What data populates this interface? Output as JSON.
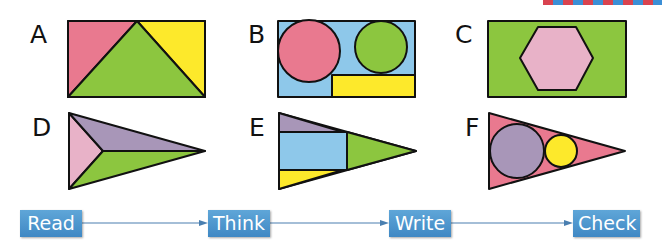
{
  "decoration": {
    "stripe_colors": [
      "#d9434f",
      "#3b8fd6"
    ]
  },
  "shapes": [
    {
      "letter": "A",
      "description": "rectangle split into pink and yellow corner triangles and a green central triangle"
    },
    {
      "letter": "B",
      "description": "blue rectangle with pink circle, green circle and yellow rectangle"
    },
    {
      "letter": "C",
      "description": "green rectangle containing a pink hexagon"
    },
    {
      "letter": "D",
      "description": "triangle split into pink, purple and green triangles"
    },
    {
      "letter": "E",
      "description": "triangle with purple triangle, blue rectangle, green triangle and yellow triangle"
    },
    {
      "letter": "F",
      "description": "pink triangle containing a purple circle and a yellow circle"
    }
  ],
  "colors": {
    "pink": "#e9798f",
    "yellow": "#fde92b",
    "green": "#8cc63f",
    "blue": "#8ec8ea",
    "light_pink": "#e8b2c8",
    "purple": "#a896b8",
    "stroke": "#111111",
    "button": "#4a93cd",
    "arrow": "#4a7fb0"
  },
  "process": {
    "steps": [
      {
        "label": "Read"
      },
      {
        "label": "Think"
      },
      {
        "label": "Write"
      },
      {
        "label": "Check"
      }
    ]
  }
}
